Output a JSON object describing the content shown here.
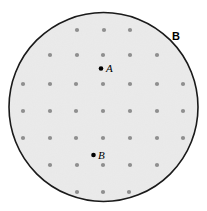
{
  "figure": {
    "type": "geometric-diagram",
    "width": 207,
    "height": 211,
    "background_color": "#ffffff"
  },
  "region": {
    "shape": "circle",
    "label": "B",
    "label_position": {
      "x": 172,
      "y": 31
    },
    "center": {
      "x": 103.5,
      "y": 107
    },
    "radius": 94.5,
    "stroke_color": "#1a1a1a",
    "stroke_width": 1.6,
    "fill_color": "#ededed"
  },
  "lattice": {
    "dot_color": "#8f8f8f",
    "dot_radius": 2.1,
    "spacing_x": 26.7,
    "spacing_y": 27,
    "columns_x": [
      23,
      50,
      76,
      103,
      130,
      157,
      183
    ],
    "rows_y": [
      30,
      55,
      84,
      111,
      138,
      165,
      192
    ],
    "points": [
      {
        "x": 77,
        "y": 30
      },
      {
        "x": 104,
        "y": 30
      },
      {
        "x": 130,
        "y": 30
      },
      {
        "x": 50,
        "y": 55
      },
      {
        "x": 77,
        "y": 55
      },
      {
        "x": 103,
        "y": 55
      },
      {
        "x": 130,
        "y": 55
      },
      {
        "x": 157,
        "y": 55
      },
      {
        "x": 23,
        "y": 84
      },
      {
        "x": 50,
        "y": 84
      },
      {
        "x": 76,
        "y": 84
      },
      {
        "x": 103,
        "y": 84
      },
      {
        "x": 130,
        "y": 84
      },
      {
        "x": 157,
        "y": 84
      },
      {
        "x": 183,
        "y": 84
      },
      {
        "x": 23,
        "y": 111
      },
      {
        "x": 50,
        "y": 111
      },
      {
        "x": 76,
        "y": 111
      },
      {
        "x": 103,
        "y": 111
      },
      {
        "x": 130,
        "y": 111
      },
      {
        "x": 157,
        "y": 111
      },
      {
        "x": 183,
        "y": 111
      },
      {
        "x": 23,
        "y": 138
      },
      {
        "x": 50,
        "y": 138
      },
      {
        "x": 76,
        "y": 138
      },
      {
        "x": 103,
        "y": 138
      },
      {
        "x": 130,
        "y": 138
      },
      {
        "x": 157,
        "y": 138
      },
      {
        "x": 183,
        "y": 138
      },
      {
        "x": 50,
        "y": 165
      },
      {
        "x": 77,
        "y": 165
      },
      {
        "x": 103,
        "y": 165
      },
      {
        "x": 130,
        "y": 165
      },
      {
        "x": 157,
        "y": 165
      },
      {
        "x": 77,
        "y": 192
      },
      {
        "x": 103,
        "y": 192
      },
      {
        "x": 129,
        "y": 192
      }
    ]
  },
  "marked_points": [
    {
      "id": "A",
      "label": "A",
      "dot": {
        "x": 101,
        "y": 68.5
      },
      "label_position": {
        "x": 106,
        "y": 63
      },
      "dot_radius": 2.3,
      "color": "#000000"
    },
    {
      "id": "B",
      "label": "B",
      "dot": {
        "x": 93.5,
        "y": 155
      },
      "label_position": {
        "x": 98,
        "y": 149.5
      },
      "dot_radius": 2.3,
      "color": "#000000"
    }
  ]
}
